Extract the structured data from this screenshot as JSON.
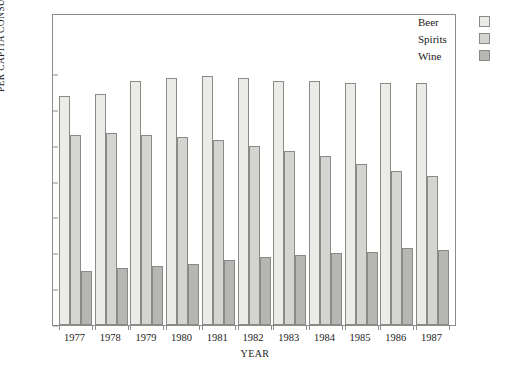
{
  "chart_data": {
    "type": "bar",
    "title": "",
    "xlabel": "YEAR",
    "ylabel": "PER CAPITA CONSUMPTION (GALLONS)",
    "categories": [
      "1977",
      "1978",
      "1979",
      "1980",
      "1981",
      "1982",
      "1983",
      "1984",
      "1985",
      "1986",
      "1987"
    ],
    "series": [
      {
        "name": "Beer",
        "color": "#ebebe8",
        "values": [
          1.28,
          1.29,
          1.36,
          1.38,
          1.39,
          1.38,
          1.36,
          1.36,
          1.35,
          1.35,
          1.35
        ]
      },
      {
        "name": "Spirits",
        "color": "#d4d4d1",
        "values": [
          1.06,
          1.07,
          1.06,
          1.05,
          1.03,
          1.0,
          0.97,
          0.94,
          0.9,
          0.86,
          0.83
        ]
      },
      {
        "name": "Wine",
        "color": "#b6b6b3",
        "values": [
          0.3,
          0.32,
          0.33,
          0.34,
          0.36,
          0.38,
          0.39,
          0.4,
          0.41,
          0.43,
          0.42
        ]
      }
    ],
    "ylim": [
      0.0,
      1.4
    ],
    "yticks": [
      "0.0",
      "0.2",
      "0.4",
      "0.6",
      "0.8",
      "1.0",
      "1.2",
      "1.4"
    ],
    "ytick_values": [
      0.0,
      0.2,
      0.4,
      0.6,
      0.8,
      1.0,
      1.2,
      1.4
    ],
    "grid": false,
    "legend_position": "top-right",
    "legend": [
      "Beer",
      "Spirits",
      "Wine"
    ]
  },
  "axis": {
    "y_title": "PER CAPITA CONSUMPTION (GALLONS)",
    "x_title": "YEAR"
  }
}
